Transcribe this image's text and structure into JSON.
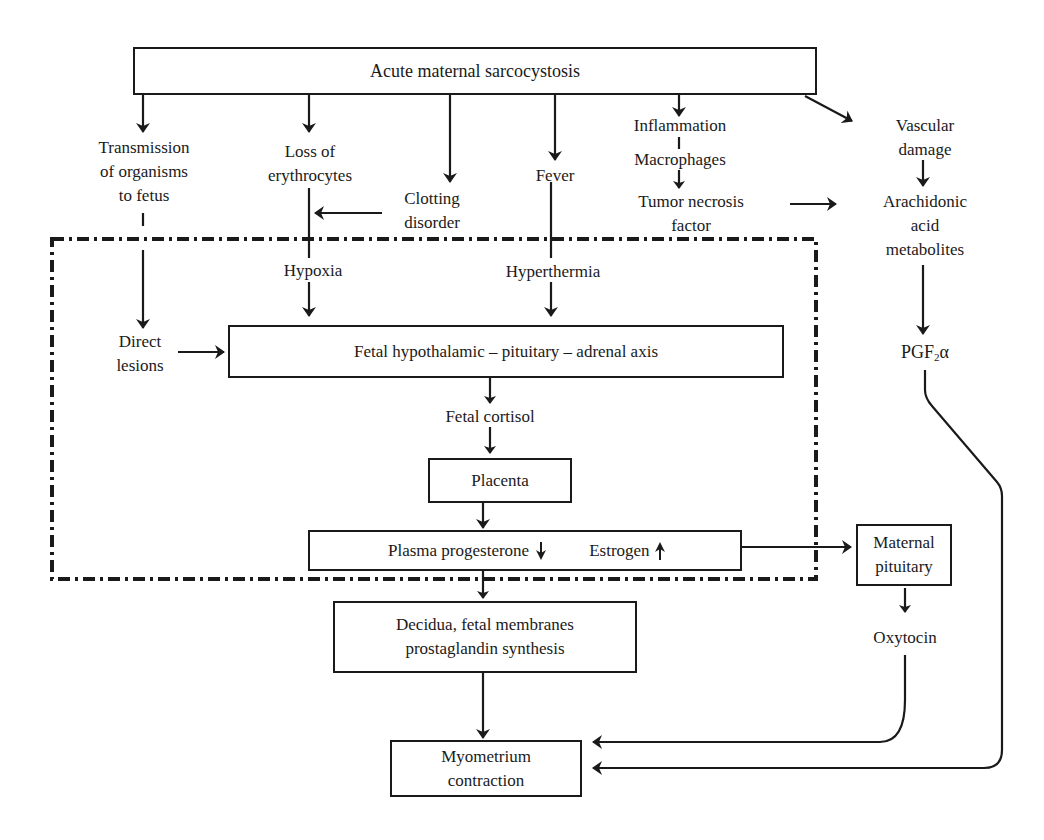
{
  "diagram": {
    "type": "flowchart",
    "title": "Acute maternal sarcocystosis",
    "nodes": {
      "root": "Acute maternal sarcocystosis",
      "transmission": [
        "Transmission",
        "of organisms",
        "to fetus"
      ],
      "loss_erythrocytes": [
        "Loss of",
        "erythrocytes"
      ],
      "clotting": [
        "Clotting",
        "disorder"
      ],
      "fever": "Fever",
      "inflammation": "Inflammation",
      "macrophages": "Macrophages",
      "tnf": [
        "Tumor necrosis",
        "factor"
      ],
      "vascular": [
        "Vascular",
        "damage"
      ],
      "arachidonic": [
        "Arachidonic",
        "acid",
        "metabolites"
      ],
      "hypoxia": "Hypoxia",
      "hyperthermia": "Hyperthermia",
      "direct_lesions": [
        "Direct",
        "lesions"
      ],
      "hpa_axis": "Fetal hypothalamic – pituitary – adrenal axis",
      "pgf": {
        "base": "PGF",
        "sub": "2",
        "suffix": "α"
      },
      "fetal_cortisol": "Fetal cortisol",
      "placenta": "Placenta",
      "progesterone": "Plasma progesterone",
      "estrogen": "Estrogen",
      "maternal_pituitary": [
        "Maternal",
        "pituitary"
      ],
      "decidua": [
        "Decidua, fetal membranes",
        "prostaglandin synthesis"
      ],
      "oxytocin": "Oxytocin",
      "myometrium": [
        "Myometrium",
        "contraction"
      ]
    },
    "indicators": {
      "progesterone_change": "down-arrow",
      "estrogen_change": "up-arrow"
    },
    "edges": [
      [
        "Acute maternal sarcocystosis",
        "Transmission of organisms to fetus"
      ],
      [
        "Acute maternal sarcocystosis",
        "Loss of erythrocytes"
      ],
      [
        "Acute maternal sarcocystosis",
        "Clotting disorder"
      ],
      [
        "Acute maternal sarcocystosis",
        "Fever"
      ],
      [
        "Acute maternal sarcocystosis",
        "Inflammation"
      ],
      [
        "Acute maternal sarcocystosis",
        "Vascular damage"
      ],
      [
        "Inflammation",
        "Macrophages"
      ],
      [
        "Macrophages",
        "Tumor necrosis factor"
      ],
      [
        "Tumor necrosis factor",
        "Arachidonic acid metabolites"
      ],
      [
        "Vascular damage",
        "Arachidonic acid metabolites"
      ],
      [
        "Clotting disorder",
        "Loss of erythrocytes"
      ],
      [
        "Loss of erythrocytes",
        "Hypoxia"
      ],
      [
        "Fever",
        "Hyperthermia"
      ],
      [
        "Transmission of organisms to fetus",
        "Direct lesions"
      ],
      [
        "Direct lesions",
        "Fetal hypothalamic-pituitary-adrenal axis"
      ],
      [
        "Hypoxia",
        "Fetal hypothalamic-pituitary-adrenal axis"
      ],
      [
        "Hyperthermia",
        "Fetal hypothalamic-pituitary-adrenal axis"
      ],
      [
        "Fetal hypothalamic-pituitary-adrenal axis",
        "Fetal cortisol"
      ],
      [
        "Fetal cortisol",
        "Placenta"
      ],
      [
        "Placenta",
        "Plasma progesterone / Estrogen"
      ],
      [
        "Estrogen",
        "Maternal pituitary"
      ],
      [
        "Plasma progesterone / Estrogen",
        "Decidua, fetal membranes prostaglandin synthesis"
      ],
      [
        "Arachidonic acid metabolites",
        "PGF2α"
      ],
      [
        "Maternal pituitary",
        "Oxytocin"
      ],
      [
        "Decidua, fetal membranes prostaglandin synthesis",
        "Myometrium contraction"
      ],
      [
        "Oxytocin",
        "Myometrium contraction"
      ],
      [
        "PGF2α",
        "Myometrium contraction"
      ]
    ],
    "regions": [
      {
        "name": "fetal-compartment",
        "style": "dash-dot"
      }
    ]
  }
}
